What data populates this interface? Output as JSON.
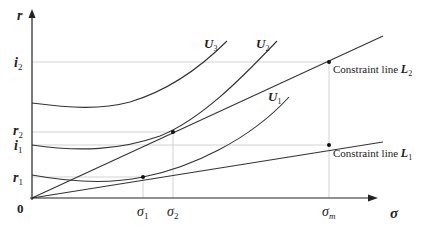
{
  "axes": {
    "y_label": "r",
    "x_label": "σ",
    "origin_label": "0"
  },
  "y_ticks": [
    {
      "id": "i2",
      "base": "i",
      "sub": "2"
    },
    {
      "id": "r2",
      "base": "r",
      "sub": "2"
    },
    {
      "id": "i1",
      "base": "i",
      "sub": "1"
    },
    {
      "id": "r1",
      "base": "r",
      "sub": "1"
    }
  ],
  "x_ticks": [
    {
      "id": "sigma1",
      "base": "σ",
      "sub": "1"
    },
    {
      "id": "sigma2",
      "base": "σ",
      "sub": "2"
    },
    {
      "id": "sigmam",
      "base": "σ",
      "sub": "m"
    }
  ],
  "curves": [
    {
      "id": "U3",
      "base": "U",
      "sub": "3"
    },
    {
      "id": "U2",
      "base": "U",
      "sub": "2"
    },
    {
      "id": "U1",
      "base": "U",
      "sub": "1"
    }
  ],
  "constraint_lines": [
    {
      "id": "L2",
      "text": "Constraint line ",
      "base": "L",
      "sub": "2"
    },
    {
      "id": "L1",
      "text": "Constraint line ",
      "base": "L",
      "sub": "1"
    }
  ]
}
